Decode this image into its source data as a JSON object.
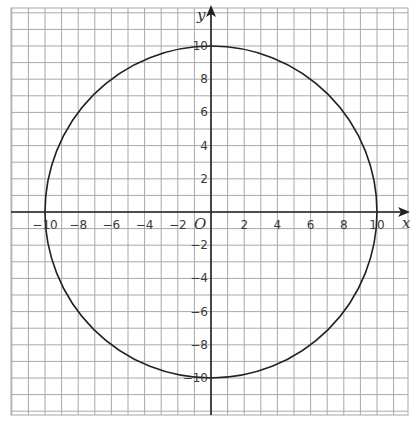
{
  "chart_data": {
    "type": "line",
    "title": "",
    "xlabel": "x",
    "ylabel": "y",
    "origin_label": "O",
    "xlim": [
      -12,
      12
    ],
    "ylim": [
      -12,
      12
    ],
    "grid": true,
    "grid_step": 1,
    "x_ticks": [
      -10,
      -8,
      -6,
      -4,
      -2,
      2,
      4,
      6,
      8,
      10
    ],
    "y_ticks": [
      10,
      8,
      6,
      4,
      2,
      -2,
      -4,
      -6,
      -8,
      -10
    ],
    "x_tick_labels": [
      "−10",
      "−8",
      "−6",
      "−4",
      "−2",
      "2",
      "4",
      "6",
      "8",
      "10"
    ],
    "y_tick_labels": [
      "10",
      "8",
      "6",
      "4",
      "2",
      "−2",
      "−4",
      "−6",
      "−8",
      "−10"
    ],
    "series": [
      {
        "name": "circle",
        "shape": "circle",
        "equation": "x^2 + y^2 = 100",
        "center": [
          0,
          0
        ],
        "radius": 10,
        "points": [
          [
            10,
            0
          ],
          [
            8,
            6
          ],
          [
            6,
            8
          ],
          [
            0,
            10
          ],
          [
            -6,
            8
          ],
          [
            -8,
            6
          ],
          [
            -10,
            0
          ],
          [
            -8,
            -6
          ],
          [
            -6,
            -8
          ],
          [
            0,
            -10
          ],
          [
            6,
            -8
          ],
          [
            8,
            -6
          ]
        ]
      }
    ],
    "legend": null
  },
  "colors": {
    "grid": "#a8a8a8",
    "axis": "#222222",
    "curve": "#222222",
    "label": "#3a3a3a"
  }
}
